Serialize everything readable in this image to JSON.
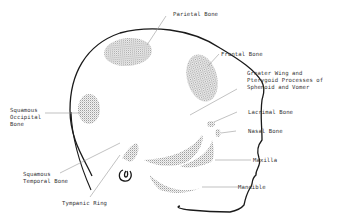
{
  "diagram": {
    "labels": [
      {
        "id": "parietal",
        "text": "Parietal Bone"
      },
      {
        "id": "frontal",
        "text": "Frontal Bone"
      },
      {
        "id": "sphenoid",
        "text": "Greater Wing and\nPterygoid Processes of\nSphenoid and Vomer"
      },
      {
        "id": "lacrimal",
        "text": "Lacrimal Bone"
      },
      {
        "id": "nasal",
        "text": "Nasal Bone"
      },
      {
        "id": "maxilla",
        "text": "Maxilla"
      },
      {
        "id": "mandible",
        "text": "Mandible"
      },
      {
        "id": "occipital",
        "text": "Squamous\nOccipital\nBone"
      },
      {
        "id": "temporal",
        "text": "Squamous\nTemporal Bone"
      },
      {
        "id": "tympanic",
        "text": "Tympanic Ring"
      }
    ],
    "colors": {
      "outline": "#1a1a1a",
      "stipple": "#9a9a9a",
      "leader": "#999999",
      "text": "#333333"
    }
  }
}
